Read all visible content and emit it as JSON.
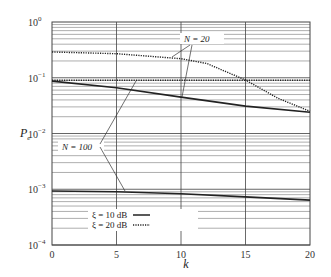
{
  "chart_data": {
    "type": "line",
    "title": "",
    "xlabel": "k",
    "ylabel": "P_e",
    "xlim": [
      0,
      20
    ],
    "ylim": [
      0.0001,
      1
    ],
    "yscale": "log",
    "grid": true,
    "x_ticks": [
      "0",
      "5",
      "10",
      "15",
      "20"
    ],
    "y_ticks": [
      {
        "base": "10",
        "exp": "0"
      },
      {
        "base": "10",
        "exp": "−1"
      },
      {
        "base": "10",
        "exp": "−2"
      },
      {
        "base": "10",
        "exp": "−3"
      },
      {
        "base": "10",
        "exp": "−4"
      }
    ],
    "x": [
      0,
      5,
      10,
      12,
      15,
      17.5,
      20
    ],
    "series": [
      {
        "name": "N = 20, ξ = 10 dB",
        "style": "solid",
        "x": [
          0,
          5,
          10,
          15,
          20
        ],
        "values": [
          0.087,
          0.066,
          0.045,
          0.031,
          0.024
        ]
      },
      {
        "name": "N = 20, ξ = 20 dB",
        "style": "dotted",
        "x": [
          0,
          5,
          10,
          12,
          15,
          17.5,
          20
        ],
        "values": [
          0.29,
          0.27,
          0.22,
          0.18,
          0.091,
          0.043,
          0.025
        ]
      },
      {
        "name": "N = 100, ξ = 10 dB",
        "style": "solid",
        "x": [
          0,
          5,
          10,
          15,
          20
        ],
        "values": [
          0.00093,
          0.0009,
          0.00083,
          0.00073,
          0.00064
        ]
      },
      {
        "name": "N = 100, ξ = 20 dB",
        "style": "dotted",
        "x": [
          0,
          5,
          10,
          15,
          20
        ],
        "values": [
          0.09,
          0.09,
          0.09,
          0.09,
          0.09
        ]
      }
    ],
    "annotations": [
      {
        "text": "N = 20",
        "points_to": [
          "N = 20, ξ = 20 dB",
          "N = 20, ξ = 10 dB"
        ]
      },
      {
        "text": "N = 100",
        "points_to": [
          "N = 100, ξ = 20 dB",
          "N = 100, ξ = 10 dB"
        ]
      }
    ],
    "legend": {
      "position": "lower center",
      "entries": [
        {
          "label": "ξ = 10 dB",
          "style": "solid"
        },
        {
          "label": "ξ = 20 dB",
          "style": "dotted"
        }
      ]
    }
  },
  "labels": {
    "xlabel": "k",
    "ylabel_main": "P",
    "ylabel_sub": "e",
    "ann_n20": "N = 20",
    "ann_n100": "N = 100",
    "legend_solid": "ξ = 10 dB",
    "legend_dotted": "ξ = 20 dB"
  }
}
